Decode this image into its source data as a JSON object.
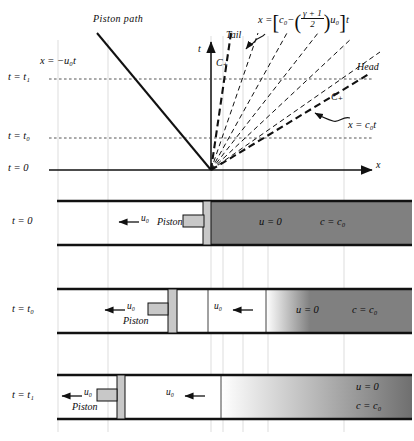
{
  "figure": {
    "type": "x-t wave diagram with piston-tube panels",
    "axis": {
      "x_label": "x",
      "t_label": "t"
    },
    "xt_labels": {
      "piston_path": "Piston path",
      "piston_path_eq": "x = −u₀t",
      "tail": "Tail",
      "head": "Head",
      "c_plus_left": "C₊",
      "c_plus_right": "C₊",
      "tail_eq_x": "x =",
      "tail_eq_c0": "c₀",
      "tail_eq_minus": "−",
      "tail_eq_num": "γ + 1",
      "tail_eq_den": "2",
      "tail_eq_u0": "u₀",
      "tail_eq_t": "t",
      "head_eq": "x = c₀t"
    },
    "time_ticks": [
      {
        "label": "t = t₁"
      },
      {
        "label": "t = t₀"
      },
      {
        "label": "t = 0"
      }
    ],
    "panels": [
      {
        "time_label": "t = 0",
        "piston_label": "Piston",
        "arrows": [
          {
            "label": "u₀"
          }
        ],
        "gas_state": {
          "u": "u = 0",
          "c": "c = c₀"
        },
        "has_expansion_fan": false
      },
      {
        "time_label": "t = t₀",
        "piston_label": "Piston",
        "arrows": [
          {
            "label": "u₀"
          },
          {
            "label": "u₀"
          }
        ],
        "gas_state": {
          "u": "u = 0",
          "c": "c = c₀"
        },
        "has_expansion_fan": true
      },
      {
        "time_label": "t = t₁",
        "piston_label": "Piston",
        "arrows": [
          {
            "label": "u₀"
          },
          {
            "label": "u₀"
          }
        ],
        "gas_state": {
          "u": "u = 0",
          "c": "c = c₀"
        },
        "has_expansion_fan": true
      }
    ],
    "colors": {
      "line": "#111111",
      "gas_fill": "#808080",
      "piston_fill": "#c8c8c8",
      "gridline": "#cfcfcf",
      "dashed_tick": "#555555"
    }
  }
}
